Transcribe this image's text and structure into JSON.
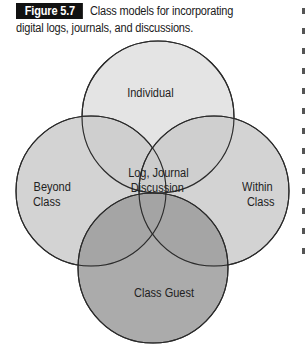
{
  "figure": {
    "label": "Figure 5.7",
    "caption": "Class models for incorporating digital logs, journals, and discussions."
  },
  "diagram": {
    "type": "venn",
    "circles": [
      {
        "id": "individual",
        "label": "Individual",
        "fill": "#e4e4e4"
      },
      {
        "id": "beyond-class",
        "label_line1": "Beyond",
        "label_line2": "Class",
        "fill": "#cbcbcb"
      },
      {
        "id": "within-class",
        "label_line1": "Within",
        "label_line2": "Class",
        "fill": "#cbcbcb"
      },
      {
        "id": "class-guest",
        "label": "Class Guest",
        "fill": "#9c9c9c"
      }
    ],
    "center": {
      "line1": "Log, Journal",
      "line2": "Discussion"
    },
    "stroke": "#2a2a2a"
  }
}
